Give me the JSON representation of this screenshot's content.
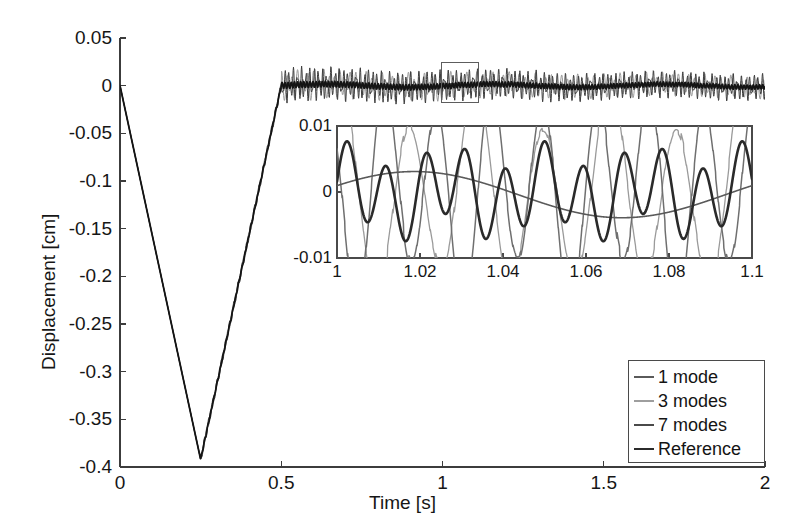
{
  "chart_data": {
    "type": "line",
    "title": "",
    "xlabel": "Time [s]",
    "ylabel": "Displacement [cm]",
    "xlim": [
      0,
      2
    ],
    "ylim": [
      -0.4,
      0.05
    ],
    "grid": false,
    "xticks": [
      "0",
      "0.5",
      "1",
      "1.5",
      "2"
    ],
    "xtick_values": [
      0,
      0.5,
      1,
      1.5,
      2
    ],
    "yticks": [
      "0.05",
      "0",
      "-0.05",
      "-0.1",
      "-0.15",
      "-0.2",
      "-0.25",
      "-0.3",
      "-0.35",
      "-0.4"
    ],
    "ytick_values": [
      0.05,
      0,
      -0.05,
      -0.1,
      -0.15,
      -0.2,
      -0.25,
      -0.3,
      -0.35,
      -0.4
    ],
    "legend_position": "lower right",
    "series": [
      {
        "name": "1 mode",
        "color": "#5a5a5a",
        "n_modes": 1,
        "description": "Single-mode approximation: ramps from 0 down to -0.39 at t=0.25, back to ~0 at t=0.5, then low-amplitude slow oscillation about 0",
        "keypoints": [
          [
            0,
            0
          ],
          [
            0.25,
            -0.39
          ],
          [
            0.5,
            -0.004
          ],
          [
            1.0,
            0.002
          ],
          [
            1.5,
            0.0
          ],
          [
            2.0,
            0.0
          ]
        ]
      },
      {
        "name": "3 modes",
        "color": "#9a9a9a",
        "n_modes": 3,
        "description": "Three-mode approximation: same V ramp, then high-frequency ringing of amplitude ~0.01 cm after t=0.5",
        "keypoints": [
          [
            0,
            0
          ],
          [
            0.25,
            -0.39
          ],
          [
            0.5,
            0.0
          ],
          [
            1.0,
            0.005
          ],
          [
            1.5,
            -0.004
          ],
          [
            2.0,
            0.003
          ]
        ]
      },
      {
        "name": "7 modes",
        "color": "#3d3d3d",
        "n_modes": 7,
        "description": "Seven-mode approximation: same V ramp, then ringing of amplitude ~0.012 cm with higher frequency content after t=0.5",
        "keypoints": [
          [
            0,
            0
          ],
          [
            0.25,
            -0.39
          ],
          [
            0.5,
            0.0
          ],
          [
            1.0,
            -0.004
          ],
          [
            1.5,
            0.006
          ],
          [
            2.0,
            -0.002
          ]
        ]
      },
      {
        "name": "Reference",
        "color": "#141414",
        "n_modes": null,
        "description": "Reference (exact) solution: V ramp to -0.392 at t=0.25, returns to 0 at t=0.5, then very small slow oscillation about 0",
        "keypoints": [
          [
            0,
            0
          ],
          [
            0.25,
            -0.392
          ],
          [
            0.5,
            -0.002
          ],
          [
            1.0,
            0.002
          ],
          [
            1.5,
            0.001
          ],
          [
            2.0,
            0.0
          ]
        ]
      }
    ],
    "annotations": [
      {
        "kind": "zoom-rectangle",
        "x_range": [
          0.99,
          1.11
        ],
        "y_range": [
          -0.012,
          0.012
        ]
      }
    ],
    "inset": {
      "type": "line",
      "xlim": [
        1,
        1.1
      ],
      "ylim": [
        -0.01,
        0.01
      ],
      "xticks": [
        "1",
        "1.02",
        "1.04",
        "1.06",
        "1.08",
        "1.1"
      ],
      "xtick_values": [
        1,
        1.02,
        1.04,
        1.06,
        1.08,
        1.1
      ],
      "yticks": [
        "0.01",
        "0",
        "-0.01"
      ],
      "ytick_values": [
        0.01,
        0,
        -0.01
      ],
      "grid": false,
      "description": "Magnified view of the steady ringing between t=1 s and t=1.1 s showing the four solutions superposed",
      "series": [
        {
          "name": "1 mode",
          "color": "#5a5a5a",
          "amplitude": 0.0035,
          "frequency_hz": 10,
          "phase": 0.4
        },
        {
          "name": "3 modes",
          "color": "#9a9a9a",
          "amplitude": 0.013,
          "frequency_hz": 62,
          "phase": 1.1
        },
        {
          "name": "7 modes",
          "color": "#6f6f6f",
          "amplitude": 0.014,
          "frequency_hz": 78,
          "phase": 2.3
        },
        {
          "name": "Reference",
          "color": "#2a2a2a",
          "amplitude": 0.0055,
          "frequency_hz": 105,
          "phase": 0.0
        }
      ]
    }
  },
  "axes": {
    "ylabel": "Displacement [cm]",
    "xlabel": "Time [s]",
    "yticks": [
      "0.05",
      "0",
      "-0.05",
      "-0.1",
      "-0.15",
      "-0.2",
      "-0.25",
      "-0.3",
      "-0.35",
      "-0.4"
    ],
    "xticks": [
      "0",
      "0.5",
      "1",
      "1.5",
      "2"
    ]
  },
  "inset_axes": {
    "yticks": [
      "0.01",
      "0",
      "-0.01"
    ],
    "xticks": [
      "1",
      "1.02",
      "1.04",
      "1.06",
      "1.08",
      "1.1"
    ]
  },
  "legend": {
    "items": [
      {
        "label": "1 mode",
        "color": "#5a5a5a"
      },
      {
        "label": "3 modes",
        "color": "#9e9e9e"
      },
      {
        "label": "7 modes",
        "color": "#4a4a4a"
      },
      {
        "label": "Reference",
        "color": "#2b2b2b"
      }
    ]
  }
}
